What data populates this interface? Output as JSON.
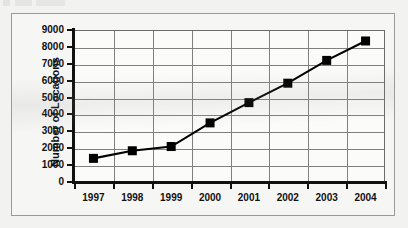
{
  "figure": {
    "background_color": "#f2f2f1",
    "frame_color": "#9a9a9a",
    "series_color": "#000000"
  },
  "chart_data": {
    "type": "line",
    "title": "",
    "xlabel": "",
    "ylabel": "Number of Locations",
    "categories": [
      "1997",
      "1998",
      "1999",
      "2000",
      "2001",
      "2002",
      "2003",
      "2004"
    ],
    "values": [
      1400,
      1850,
      2100,
      3500,
      4700,
      5850,
      7200,
      8350
    ],
    "series": [
      {
        "name": "Number of Locations",
        "values": [
          1400,
          1850,
          2100,
          3500,
          4700,
          5850,
          7200,
          8350
        ]
      }
    ],
    "ylim": [
      0,
      9000
    ],
    "ytick_labels": [
      "0",
      "1000",
      "2000",
      "3000",
      "4000",
      "5000",
      "6000",
      "7000",
      "8000",
      "9000"
    ],
    "ytick_values": [
      0,
      1000,
      2000,
      3000,
      4000,
      5000,
      6000,
      7000,
      8000,
      9000
    ],
    "ytick_step": 1000,
    "grid": "both",
    "legend": "none",
    "marker": "square",
    "marker_color": "#000000",
    "line_color": "#000000"
  }
}
